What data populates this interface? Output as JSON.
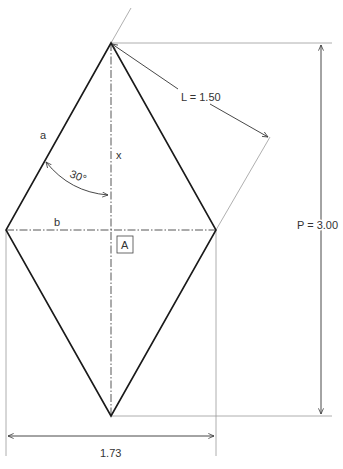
{
  "diagram": {
    "type": "rhombus-dimension-drawing",
    "shape": "rhombus",
    "labels": {
      "side": "a",
      "half_height": "x",
      "half_width": "b",
      "area_marker": "A",
      "angle": "30°",
      "side_length": "L = 1.50",
      "height": "P = 3.00",
      "width": "1.73"
    },
    "dimensions": {
      "side_length": 1.5,
      "total_height": 3.0,
      "total_width": 1.73,
      "half_angle_deg": 30
    },
    "colors": {
      "outline": "#1a1a1a",
      "dimension": "#333333",
      "extension": "#999999",
      "text": "#333333"
    }
  }
}
